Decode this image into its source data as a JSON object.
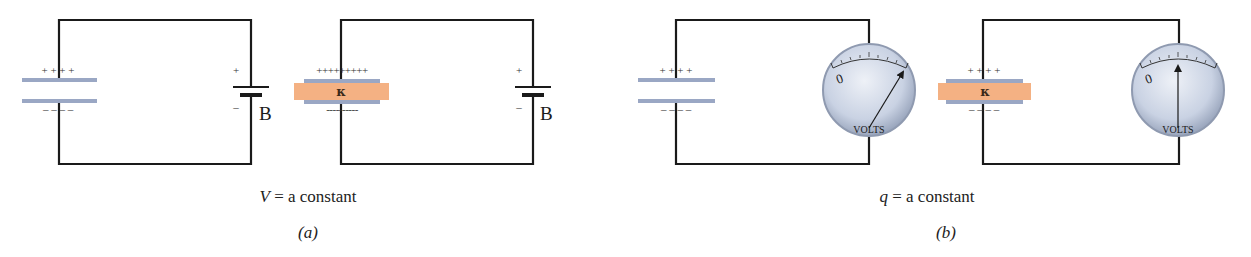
{
  "figure": {
    "panel_a": {
      "label": "(a)",
      "caption_var": "V",
      "caption_rest": " = a constant",
      "circuit_without_dielectric": {
        "plate_top_charges": "+ + + +",
        "plate_bottom_charges": "– – – –",
        "battery_label": "B",
        "battery_plus": "+",
        "battery_minus": "–"
      },
      "circuit_with_dielectric": {
        "plate_top_charges": "+++++++++",
        "plate_bottom_charges": "----------",
        "dielectric_symbol": "κ",
        "battery_label": "B",
        "battery_plus": "+",
        "battery_minus": "–"
      }
    },
    "panel_b": {
      "label": "(b)",
      "caption_var": "q",
      "caption_rest": " = a constant",
      "circuit_without_dielectric": {
        "plate_top_charges": "+ + + +",
        "plate_bottom_charges": "– – – –",
        "meter_zero": "0",
        "meter_label": "VOLTS",
        "needle_reading": "high"
      },
      "circuit_with_dielectric": {
        "plate_top_charges": "+ + + +",
        "plate_bottom_charges": "– – – –",
        "dielectric_symbol": "κ",
        "meter_zero": "0",
        "meter_label": "VOLTS",
        "needle_reading": "lower"
      }
    },
    "colors": {
      "wire": "#1a1a1a",
      "plate": "#9aa7c4",
      "dielectric": "#f4b183",
      "meter_face": "#c9d2e3",
      "meter_rim": "#8f9ab0"
    }
  }
}
